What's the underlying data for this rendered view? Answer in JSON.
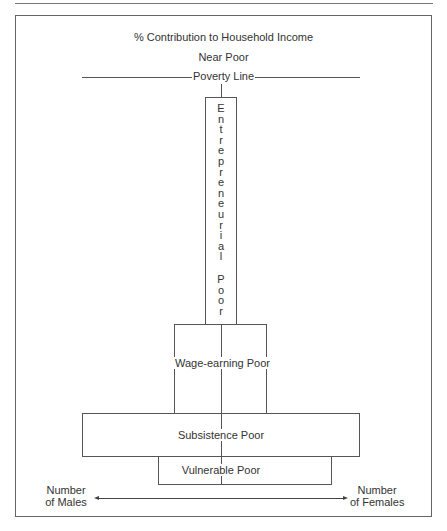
{
  "diagram": {
    "title": "% Contribution to Household Income",
    "near_poor_label": "Near Poor",
    "poverty_line_label": "Poverty Line",
    "tiers": [
      {
        "name": "entrepreneurial",
        "label": "Entrepreneurial Poor",
        "letters": [
          "E",
          "n",
          "t",
          "r",
          "e",
          "p",
          "r",
          "e",
          "n",
          "e",
          "u",
          "r",
          "i",
          "a",
          "l",
          " ",
          "P",
          "o",
          "o",
          "r"
        ]
      },
      {
        "name": "wage-earning",
        "label": "Wage-earning Poor"
      },
      {
        "name": "subsistence",
        "label": "Subsistence Poor"
      },
      {
        "name": "vulnerable",
        "label": "Vulnerable Poor"
      }
    ],
    "axis": {
      "left_label_line1": "Number",
      "left_label_line2": "of Males",
      "right_label_line1": "Number",
      "right_label_line2": "of Females"
    },
    "colors": {
      "line": "#555555",
      "text": "#333333",
      "background": "#ffffff"
    }
  }
}
